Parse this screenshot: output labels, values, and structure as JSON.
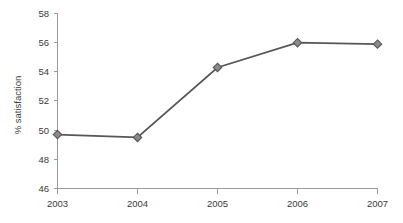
{
  "chart_data": {
    "type": "line",
    "title": "",
    "subtitle": "",
    "xlabel": "",
    "ylabel": "% satisfaction",
    "categories": [
      "2003",
      "2004",
      "2005",
      "2006",
      "2007"
    ],
    "values": [
      49.7,
      49.5,
      54.3,
      56.0,
      55.9
    ],
    "series": [
      {
        "name": "% satisfaction",
        "values": [
          49.7,
          49.5,
          54.3,
          56.0,
          55.9
        ]
      }
    ],
    "ylim": [
      46,
      58
    ],
    "ytick_labels": [
      "46",
      "48",
      "50",
      "52",
      "54",
      "56",
      "58"
    ],
    "ytick_values": [
      46,
      48,
      50,
      52,
      54,
      56,
      58
    ],
    "xtick_labels": [
      "2003",
      "2004",
      "2005",
      "2006",
      "2007"
    ],
    "grid": false,
    "legend": false,
    "legend_position": "none",
    "marker": "diamond",
    "colors": {
      "line": "#565656",
      "marker_fill": "#8a8a8a",
      "marker_stroke": "#565656",
      "axis": "#9a9a9a",
      "text": "#3a3a3a",
      "background": "#ffffff"
    }
  }
}
